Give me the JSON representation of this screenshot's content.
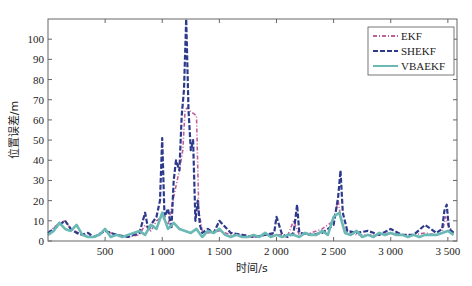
{
  "chart_data": {
    "type": "line",
    "title": "",
    "xlabel": "时间/s",
    "ylabel": "位置误差/m",
    "xlim": [
      0,
      3580
    ],
    "ylim": [
      0,
      110
    ],
    "xticks": [
      500,
      1000,
      1500,
      2000,
      2500,
      3000,
      3500
    ],
    "xtick_labels": [
      "500",
      "1 000",
      "1 500",
      "2 000",
      "2 500",
      "3 000",
      "3 500"
    ],
    "yticks": [
      0,
      10,
      20,
      30,
      40,
      50,
      60,
      70,
      80,
      90,
      100
    ],
    "ytick_labels": [
      "0",
      "10",
      "20",
      "30",
      "40",
      "50",
      "60",
      "70",
      "80",
      "90",
      "100"
    ],
    "grid": false,
    "legend_position": "upper right",
    "series": [
      {
        "name": "EKF",
        "color": "#c0609a",
        "style": "dash-dot",
        "x": [
          0,
          100,
          150,
          200,
          300,
          400,
          500,
          600,
          700,
          800,
          850,
          900,
          950,
          1000,
          1050,
          1100,
          1150,
          1180,
          1200,
          1220,
          1250,
          1280,
          1300,
          1320,
          1350,
          1400,
          1500,
          1600,
          1700,
          1800,
          1900,
          2000,
          2100,
          2150,
          2200,
          2300,
          2400,
          2500,
          2540,
          2560,
          2600,
          2700,
          2800,
          2900,
          3000,
          3100,
          3200,
          3300,
          3400,
          3450,
          3480,
          3500,
          3550
        ],
        "values": [
          4,
          9,
          10,
          6,
          3,
          2,
          5,
          3,
          2,
          3,
          8,
          5,
          10,
          12,
          8,
          22,
          35,
          45,
          65,
          66,
          64,
          63,
          62,
          15,
          5,
          4,
          5,
          3,
          3,
          2,
          3,
          3,
          3,
          10,
          3,
          4,
          6,
          10,
          20,
          12,
          5,
          3,
          3,
          3,
          4,
          3,
          3,
          4,
          3,
          4,
          12,
          8,
          4
        ]
      },
      {
        "name": "SHEKF",
        "color": "#2d3a8c",
        "style": "dashed",
        "x": [
          0,
          100,
          150,
          200,
          250,
          300,
          350,
          400,
          500,
          600,
          700,
          800,
          850,
          880,
          900,
          950,
          980,
          1000,
          1020,
          1050,
          1080,
          1100,
          1120,
          1150,
          1170,
          1190,
          1210,
          1230,
          1250,
          1270,
          1290,
          1310,
          1330,
          1350,
          1400,
          1450,
          1500,
          1600,
          1700,
          1800,
          1900,
          1980,
          2000,
          2050,
          2100,
          2150,
          2180,
          2200,
          2300,
          2400,
          2500,
          2540,
          2560,
          2580,
          2620,
          2700,
          2800,
          2900,
          3000,
          3100,
          3200,
          3300,
          3400,
          3450,
          3470,
          3490,
          3510,
          3550
        ],
        "values": [
          4,
          8,
          10,
          6,
          4,
          3,
          4,
          2,
          5,
          3,
          2,
          4,
          14,
          5,
          8,
          12,
          20,
          51,
          12,
          16,
          6,
          30,
          40,
          35,
          62,
          75,
          110,
          65,
          45,
          50,
          10,
          20,
          8,
          4,
          6,
          4,
          10,
          4,
          3,
          2,
          3,
          4,
          12,
          3,
          2,
          4,
          18,
          4,
          3,
          4,
          8,
          22,
          35,
          14,
          5,
          4,
          5,
          3,
          6,
          3,
          3,
          8,
          4,
          6,
          15,
          18,
          6,
          4
        ]
      },
      {
        "name": "VBAEKF",
        "color": "#6ab9b5",
        "style": "solid",
        "x": [
          0,
          50,
          100,
          150,
          200,
          250,
          300,
          350,
          400,
          450,
          500,
          550,
          600,
          650,
          700,
          750,
          800,
          850,
          900,
          950,
          1000,
          1050,
          1100,
          1150,
          1200,
          1250,
          1300,
          1350,
          1400,
          1450,
          1500,
          1550,
          1600,
          1650,
          1700,
          1750,
          1800,
          1850,
          1900,
          1950,
          2000,
          2050,
          2100,
          2150,
          2200,
          2250,
          2300,
          2350,
          2400,
          2450,
          2500,
          2550,
          2600,
          2650,
          2700,
          2750,
          2800,
          2850,
          2900,
          2950,
          3000,
          3050,
          3100,
          3150,
          3200,
          3250,
          3300,
          3350,
          3400,
          3450,
          3500,
          3550
        ],
        "values": [
          3,
          5,
          9,
          6,
          5,
          8,
          3,
          2,
          2,
          3,
          6,
          2,
          3,
          2,
          3,
          4,
          5,
          3,
          8,
          6,
          14,
          6,
          9,
          6,
          5,
          4,
          6,
          2,
          5,
          4,
          6,
          3,
          2,
          3,
          2,
          2,
          3,
          2,
          4,
          2,
          3,
          2,
          3,
          3,
          2,
          4,
          3,
          3,
          5,
          3,
          12,
          14,
          4,
          3,
          5,
          2,
          3,
          2,
          4,
          3,
          4,
          3,
          3,
          2,
          3,
          2,
          3,
          3,
          3,
          4,
          5,
          3
        ]
      }
    ]
  }
}
